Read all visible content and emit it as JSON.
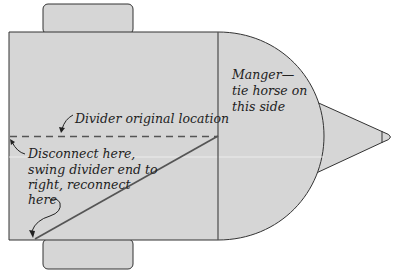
{
  "diagram": {
    "type": "trailer-top-view",
    "colors": {
      "fill": "#d6d6d6",
      "outline": "#333333",
      "divider": "#555555",
      "text": "#222222",
      "background": "#ffffff"
    },
    "labels": {
      "manger_line1": "Manger—",
      "manger_line2": "tie horse on",
      "manger_line3": "this side",
      "divider_original": "Divider original location",
      "disconnect_line1": "Disconnect here,",
      "disconnect_line2": "swing divider end to",
      "disconnect_line3": "right, reconnect",
      "disconnect_line4": "here"
    }
  }
}
